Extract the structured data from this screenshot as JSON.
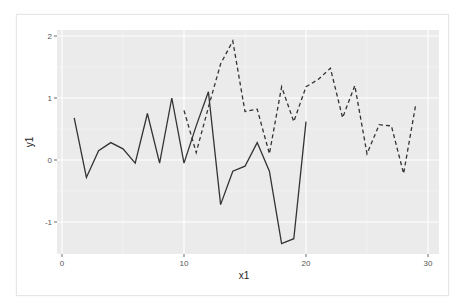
{
  "chart_data": {
    "type": "line",
    "title": "",
    "xlabel": "x1",
    "ylabel": "y1",
    "xlim": [
      0,
      30
    ],
    "ylim": [
      -1.5,
      2.1
    ],
    "x_ticks": [
      "0",
      "10",
      "20",
      "30"
    ],
    "y_ticks": [
      "-1",
      "0",
      "1",
      "2"
    ],
    "grid": true,
    "legend": "none",
    "series": [
      {
        "name": "solid",
        "linetype": "solid",
        "color": "#333333",
        "x": [
          1,
          2,
          3,
          4,
          5,
          6,
          7,
          8,
          9,
          10,
          11,
          12,
          13,
          14,
          15,
          16,
          17,
          18,
          19,
          20
        ],
        "values": [
          0.68,
          -0.28,
          0.15,
          0.28,
          0.18,
          -0.05,
          0.75,
          -0.05,
          1.0,
          -0.05,
          0.55,
          1.1,
          -0.72,
          -0.18,
          -0.1,
          0.28,
          -0.18,
          -1.35,
          -1.27,
          0.62
        ]
      },
      {
        "name": "dashed",
        "linetype": "dashed",
        "color": "#333333",
        "x": [
          10,
          11,
          12,
          13,
          14,
          15,
          16,
          17,
          18,
          19,
          20,
          21,
          22,
          23,
          24,
          25,
          26,
          27,
          28,
          29
        ],
        "values": [
          0.8,
          0.12,
          0.85,
          1.55,
          1.92,
          0.78,
          0.82,
          0.1,
          1.18,
          0.62,
          1.18,
          1.3,
          1.48,
          0.68,
          1.2,
          0.1,
          0.57,
          0.55,
          -0.22,
          0.9
        ]
      }
    ]
  },
  "colors": {
    "panel_background": "#ebebeb",
    "grid_major": "#ffffff",
    "grid_minor": "#f5f5f5",
    "line": "#333333",
    "tick_text": "#555555"
  }
}
